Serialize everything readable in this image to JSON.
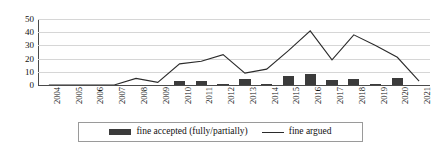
{
  "chart_data": {
    "type": "bar",
    "title": "",
    "subtitle": "",
    "xlabel": "",
    "ylabel": "",
    "ylim": [
      0,
      50
    ],
    "yticks": [
      0,
      10,
      20,
      30,
      40,
      50
    ],
    "grid": true,
    "legend_position": "bottom",
    "categories": [
      "2004",
      "2005",
      "2006",
      "2007",
      "2008",
      "2009",
      "2010",
      "2011",
      "2012",
      "2013",
      "2014",
      "2015",
      "2016",
      "2017",
      "2018",
      "2019",
      "2020",
      "2021"
    ],
    "series": [
      {
        "name": "fine accepted (fully/partially)",
        "type": "bar",
        "color": "#3b3b3b",
        "values": [
          0,
          0,
          0,
          0,
          0,
          0,
          3,
          3,
          0.5,
          4.5,
          0.5,
          7,
          8,
          4,
          4.5,
          1,
          5.5,
          0
        ]
      },
      {
        "name": "fine argued",
        "type": "line",
        "color": "#2b2b2b",
        "values": [
          0,
          0,
          0,
          0,
          5,
          2,
          16,
          18,
          23,
          9,
          12,
          26,
          41,
          19,
          38,
          30,
          21,
          3
        ]
      }
    ]
  },
  "legend": {
    "entries": [
      {
        "label": "fine accepted (fully/partially)",
        "marker": "bar-swatch"
      },
      {
        "label": "fine argued",
        "marker": "line-swatch"
      }
    ]
  }
}
